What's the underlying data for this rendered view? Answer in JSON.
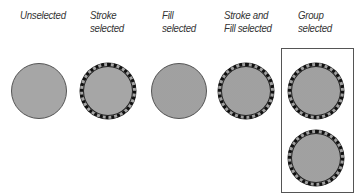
{
  "labels": {
    "unselected": "Unselected",
    "stroke_selected_1": "Stroke",
    "stroke_selected_2": "selected",
    "fill_selected_1": "Fill",
    "fill_selected_2": "selected",
    "stroke_fill_selected_1": "Stroke and",
    "stroke_fill_selected_2": "Fill selected",
    "group_selected_1": "Group",
    "group_selected_2": "selected"
  },
  "colors": {
    "fill": "#a6a6a6",
    "stroke": "#555555",
    "selection_stroke": "#111111",
    "group_box": "#555555"
  }
}
